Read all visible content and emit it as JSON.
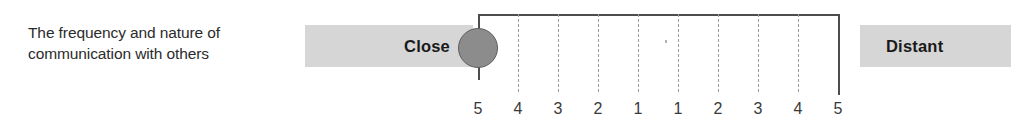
{
  "item": {
    "label": "The frequency and nature of\ncommunication with others"
  },
  "scale": {
    "left_anchor": "Close",
    "right_anchor": "Distant",
    "tick_labels": [
      "5",
      "4",
      "3",
      "2",
      "1",
      "1",
      "2",
      "3",
      "4",
      "5"
    ],
    "selected_tick_index": 0,
    "selected_value": "5",
    "selected_pole": "Close"
  },
  "colors": {
    "bar_gray": "#d6d6d6",
    "marker_gray": "#8c8c8c",
    "marker_border": "#5e5e5e",
    "rail": "#4d4d4d",
    "dashed_tick": "#9b9b9b",
    "text": "#2b2b2b"
  },
  "geometry": {
    "tick_x": [
      478,
      518,
      558,
      598,
      638,
      678,
      718,
      758,
      798,
      838
    ],
    "rail_y": 14,
    "solid_tick_indices": [
      0,
      9
    ],
    "dashed_tick_height": 78,
    "solid_tick_height_left": 66,
    "solid_tick_height_right": 81,
    "marker_center": [
      478,
      48
    ]
  }
}
